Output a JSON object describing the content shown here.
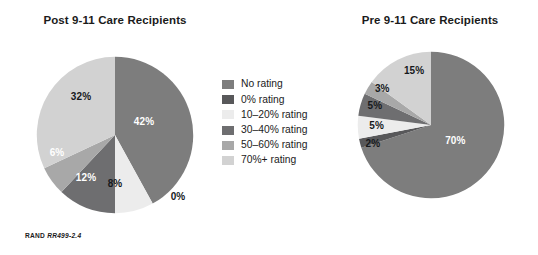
{
  "figure": {
    "credit_org": "RAND",
    "credit_id": "RR499-2.4",
    "background": "#ffffff"
  },
  "legend": {
    "items": [
      {
        "label": "No rating",
        "color": "#7d7d7d"
      },
      {
        "label": "0% rating",
        "color": "#58585a"
      },
      {
        "label": "10–20% rating",
        "color": "#ececec"
      },
      {
        "label": "30–40% rating",
        "color": "#6e6e70"
      },
      {
        "label": "50–60% rating",
        "color": "#a8a8a8"
      },
      {
        "label": "70%+ rating",
        "color": "#d2d2d2"
      }
    ]
  },
  "chart_data": [
    {
      "type": "pie",
      "id": "post",
      "title": "Post 9-11 Care Recipients",
      "categories": [
        "No rating",
        "0% rating",
        "10–20% rating",
        "30–40% rating",
        "50–60% rating",
        "70%+ rating"
      ],
      "values": [
        42,
        0,
        8,
        12,
        6,
        32
      ],
      "labels": [
        "42%",
        "0%",
        "8%",
        "12%",
        "6%",
        "32%"
      ],
      "colors": [
        "#7d7d7d",
        "#58585a",
        "#ececec",
        "#6e6e70",
        "#a8a8a8",
        "#d2d2d2"
      ],
      "label_positions": [
        {
          "x": 108,
          "y": 65,
          "dark": true
        },
        {
          "x": 142,
          "y": 140,
          "dark": false
        },
        {
          "x": 79,
          "y": 127,
          "dark": false
        },
        {
          "x": 50,
          "y": 121,
          "dark": true
        },
        {
          "x": 21,
          "y": 96,
          "dark": true
        },
        {
          "x": 45,
          "y": 40,
          "dark": false
        }
      ],
      "start_angle": 0,
      "direction": "clockwise",
      "legend_position": "center"
    },
    {
      "type": "pie",
      "id": "pre",
      "title": "Pre 9-11 Care Recipients",
      "categories": [
        "No rating",
        "0% rating",
        "10–20% rating",
        "30–40% rating",
        "50–60% rating",
        "70%+ rating"
      ],
      "values": [
        70,
        2,
        5,
        5,
        3,
        15
      ],
      "labels": [
        "70%",
        "2%",
        "5%",
        "5%",
        "3%",
        "15%"
      ],
      "colors": [
        "#7d7d7d",
        "#58585a",
        "#ececec",
        "#6e6e70",
        "#a8a8a8",
        "#d2d2d2"
      ],
      "label_positions": [
        {
          "x": 105,
          "y": 95,
          "dark": true
        },
        {
          "x": 17,
          "y": 98,
          "dark": false
        },
        {
          "x": 21,
          "y": 79,
          "dark": false
        },
        {
          "x": 19,
          "y": 58,
          "dark": false
        },
        {
          "x": 27,
          "y": 40,
          "dark": false
        },
        {
          "x": 61,
          "y": 20,
          "dark": false
        }
      ],
      "start_angle": 0,
      "direction": "clockwise",
      "legend_position": "center"
    }
  ]
}
